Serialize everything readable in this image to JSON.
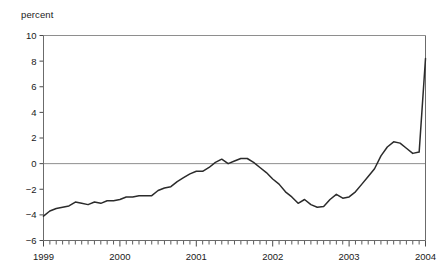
{
  "figure": {
    "unit_label": "percent",
    "background_color": "#ffffff",
    "line_color": "#2b2b2b",
    "axis_color": "#6b6b6b",
    "grid_color": "#8e8e8e"
  },
  "chart_data": {
    "type": "line",
    "title": "",
    "subtitle": "",
    "xlabel": "",
    "ylabel": "percent",
    "ylim": [
      -6,
      10
    ],
    "xlim": [
      1999.0,
      2004.0
    ],
    "yticks": [
      -6,
      -4,
      -2,
      0,
      2,
      4,
      6,
      8,
      10
    ],
    "ytick_labels": [
      "-6",
      "-4",
      "-2",
      "0",
      "2",
      "4",
      "6",
      "8",
      "10"
    ],
    "xticks": [
      1999,
      2000,
      2001,
      2002,
      2003,
      2004
    ],
    "xtick_labels": [
      "1999",
      "2000",
      "2001",
      "2002",
      "2003",
      "2004"
    ],
    "minor_tick_interval": 0.0833333,
    "grid": "horizontal-at-0-and-10",
    "legend": "none",
    "zero_line": true,
    "series": [
      {
        "name": "percent change",
        "x": [
          1999.0,
          1999.083,
          1999.167,
          1999.25,
          1999.333,
          1999.417,
          1999.5,
          1999.583,
          1999.667,
          1999.75,
          1999.833,
          1999.917,
          2000.0,
          2000.083,
          2000.167,
          2000.25,
          2000.333,
          2000.417,
          2000.5,
          2000.583,
          2000.667,
          2000.75,
          2000.833,
          2000.917,
          2001.0,
          2001.083,
          2001.167,
          2001.25,
          2001.333,
          2001.417,
          2001.5,
          2001.583,
          2001.667,
          2001.75,
          2001.833,
          2001.917,
          2002.0,
          2002.083,
          2002.167,
          2002.25,
          2002.333,
          2002.417,
          2002.5,
          2002.583,
          2002.667,
          2002.75,
          2002.833,
          2002.917,
          2003.0,
          2003.083,
          2003.167,
          2003.25,
          2003.333,
          2003.417,
          2003.5,
          2003.583,
          2003.667,
          2003.75,
          2003.833,
          2003.917,
          2004.0
        ],
        "values": [
          -4.1,
          -3.7,
          -3.5,
          -3.4,
          -3.3,
          -3.0,
          -3.1,
          -3.2,
          -3.0,
          -3.1,
          -2.9,
          -2.9,
          -2.8,
          -2.6,
          -2.6,
          -2.5,
          -2.5,
          -2.5,
          -2.1,
          -1.9,
          -1.8,
          -1.4,
          -1.1,
          -0.8,
          -0.6,
          -0.6,
          -0.3,
          0.1,
          0.35,
          0.0,
          0.2,
          0.4,
          0.4,
          0.1,
          -0.3,
          -0.7,
          -1.2,
          -1.6,
          -2.2,
          -2.6,
          -3.1,
          -2.8,
          -3.2,
          -3.4,
          -3.35,
          -2.8,
          -2.4,
          -2.7,
          -2.6,
          -2.2,
          -1.6,
          -1.0,
          -0.4,
          0.6,
          1.3,
          1.7,
          1.6,
          1.2,
          0.8,
          0.9,
          8.2
        ],
        "values_detail_note": "monthly series, 1999-01 through 2004-01"
      }
    ],
    "annotations": []
  }
}
